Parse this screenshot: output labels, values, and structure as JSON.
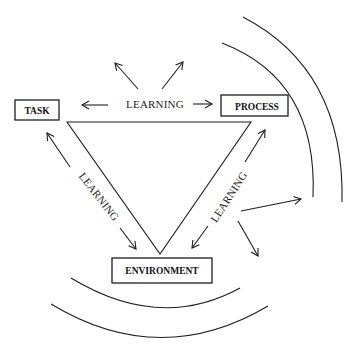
{
  "diagram": {
    "nodes": {
      "task": {
        "label": "TASK"
      },
      "process": {
        "label": "PROCESS"
      },
      "environment": {
        "label": "ENVIRONMENT"
      }
    },
    "edges": {
      "top": {
        "label": "LEARNING",
        "between": [
          "TASK",
          "PROCESS"
        ]
      },
      "left": {
        "label": "LEARNING",
        "between": [
          "TASK",
          "ENVIRONMENT"
        ]
      },
      "right": {
        "label": "LEARNING",
        "between": [
          "PROCESS",
          "ENVIRONMENT"
        ]
      }
    },
    "colors": {
      "stroke": "#1e1e1e",
      "background": "#ffffff"
    }
  }
}
